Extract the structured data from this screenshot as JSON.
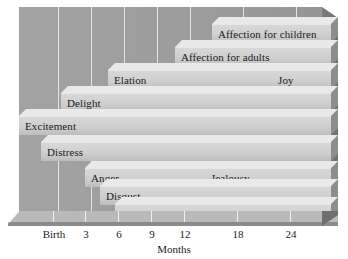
{
  "chart_data": {
    "type": "bar",
    "title": "",
    "subtitle": "",
    "xlabel": "Months",
    "ylabel": "",
    "xlim": [
      0,
      27
    ],
    "grid": true,
    "legend": null,
    "orientation": "horizontal",
    "note": "Horizontal 3D range (Gantt-style) chart of ages at which emotions emerge",
    "tick_labels": [
      "Birth",
      "3",
      "6",
      "9",
      "12",
      "18",
      "24"
    ],
    "tick_values": [
      0,
      3,
      6,
      9,
      12,
      18,
      24
    ],
    "categories": [
      "Affection for children",
      "Affection for adults",
      "Joy",
      "Elation",
      "Delight",
      "Excitement",
      "Distress",
      "Anger",
      "Jealousy",
      "Disgust",
      "Fear"
    ],
    "bars": [
      {
        "label": "Affection for children",
        "start_month": 18,
        "end_month": 27,
        "label_side": "left"
      },
      {
        "label": "Affection for adults",
        "start_month": 15,
        "end_month": 27,
        "label_side": "left"
      },
      {
        "label": "Joy",
        "start_month": 21,
        "end_month": 27,
        "label_side": "left"
      },
      {
        "label": "Elation",
        "start_month": 9,
        "end_month": 27,
        "label_side": "left"
      },
      {
        "label": "Delight",
        "start_month": 4,
        "end_month": 27,
        "label_side": "left"
      },
      {
        "label": "Excitement",
        "start_month": 0,
        "end_month": 27,
        "label_side": "left"
      },
      {
        "label": "Distress",
        "start_month": 2,
        "end_month": 27,
        "label_side": "left"
      },
      {
        "label": "Anger",
        "start_month": 5,
        "end_month": 27,
        "label_side": "left"
      },
      {
        "label": "Jealousy",
        "start_month": 17,
        "end_month": 27,
        "label_side": "left"
      },
      {
        "label": "Disgust",
        "start_month": 6,
        "end_month": 27,
        "label_side": "left"
      },
      {
        "label": "Fear",
        "start_month": 7,
        "end_month": 27,
        "label_side": "left"
      }
    ],
    "colors": {
      "plot_background": "#9e9e9e",
      "bar_face": "#cfcfcf",
      "bar_top": "#e9e9e9",
      "bar_side": "#8d8d8d",
      "gridline": "#e8e8e8",
      "floor_top": "#b9b9b9",
      "floor_front": "#8b8b8b",
      "text": "#1a1a1a",
      "page_background": "#ffffff"
    }
  },
  "bar_rows": [
    {
      "label": "Affection for children",
      "left": 193,
      "right": 319,
      "top": 10,
      "label_offset": 6
    },
    {
      "label": "Affection for adults",
      "left": 156,
      "right": 319,
      "top": 33,
      "label_offset": 6
    },
    {
      "label": "Elation",
      "left": 89,
      "right": 319,
      "top": 56,
      "label_offset": 6
    },
    {
      "label": "Joy",
      "left": 253,
      "right": 319,
      "top": 56,
      "label_offset": 6
    },
    {
      "label": "Delight",
      "left": 42,
      "right": 319,
      "top": 79,
      "label_offset": 6
    },
    {
      "label": "Excitement",
      "left": 0,
      "right": 319,
      "top": 102,
      "label_offset": 6
    },
    {
      "label": "Distress",
      "left": 22,
      "right": 319,
      "top": 128,
      "label_offset": 6
    },
    {
      "label": "Anger",
      "left": 66,
      "right": 319,
      "top": 154,
      "label_offset": 6
    },
    {
      "label": "Jealousy",
      "left": 186,
      "right": 319,
      "top": 154,
      "label_offset": 6
    },
    {
      "label": "Disgust",
      "left": 81,
      "right": 319,
      "top": 172,
      "label_offset": 6
    },
    {
      "label": "Fear",
      "left": 96,
      "right": 319,
      "top": 190,
      "label_offset": 6
    }
  ],
  "gridlines_x": [
    39,
    72,
    105,
    138,
    171,
    224,
    277
  ],
  "axis": {
    "ticks": [
      {
        "label": "Birth",
        "x": 40
      },
      {
        "label": "3",
        "x": 72
      },
      {
        "label": "6",
        "x": 105
      },
      {
        "label": "9",
        "x": 138
      },
      {
        "label": "12",
        "x": 171
      },
      {
        "label": "18",
        "x": 224
      },
      {
        "label": "24",
        "x": 277
      }
    ],
    "title": "Months"
  }
}
